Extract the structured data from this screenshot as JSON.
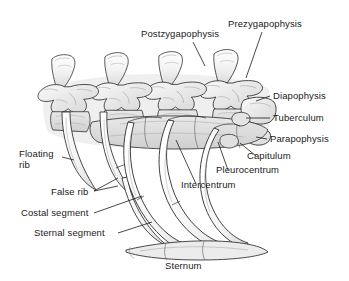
{
  "figure": {
    "background_color": "#ffffff",
    "ink_color": "#1a1a1a",
    "shade_color": "#d8d8d8",
    "width": 349,
    "height": 281
  },
  "labels": {
    "postzygapophysis": "Postzygapophysis",
    "prezygapophysis": "Prezygapophysis",
    "diapophysis": "Diapophysis",
    "tuberculum": "Tuberculum",
    "parapophysis": "Parapophysis",
    "capitulum": "Capitulum",
    "pleurocentrum": "Pleurocentrum",
    "intercentrum": "Intercentrum",
    "floating_rib_line1": "Floating",
    "floating_rib_line2": "rib",
    "false_rib": "False rib",
    "costal_segment": "Costal segment",
    "sternal_segment": "Sternal segment",
    "sternum": "Sternum"
  },
  "structures": [
    {
      "name": "vertebra-1",
      "description": "leftmost thoracic vertebra with neural spine"
    },
    {
      "name": "vertebra-2",
      "description": "second thoracic vertebra"
    },
    {
      "name": "vertebra-3",
      "description": "third thoracic vertebra"
    },
    {
      "name": "vertebra-4",
      "description": "rightmost thoracic vertebra"
    },
    {
      "name": "floating-rib",
      "description": "short unattached rib on the left"
    },
    {
      "name": "false-rib",
      "description": "rib not reaching sternum directly"
    },
    {
      "name": "true-rib-1",
      "description": "curved rib reaching the sternum"
    },
    {
      "name": "true-rib-2",
      "description": "curved rib reaching the sternum"
    },
    {
      "name": "true-rib-3",
      "description": "curved rib reaching the sternum"
    },
    {
      "name": "sternum-bone",
      "description": "horizontal sternum plate at bottom"
    }
  ]
}
